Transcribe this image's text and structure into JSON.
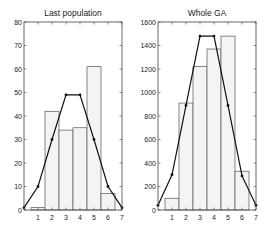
{
  "figure": {
    "width": 269,
    "height": 232
  },
  "chart_data": [
    {
      "type": "bar",
      "title": "Last population",
      "xlabel": "",
      "ylabel": "",
      "xlim": [
        0,
        7
      ],
      "ylim": [
        0,
        80
      ],
      "xticks": [
        1,
        2,
        3,
        4,
        5,
        6,
        7
      ],
      "yticks": [
        0,
        10,
        20,
        30,
        40,
        50,
        60,
        70,
        80
      ],
      "grid": false,
      "legend": null,
      "categories": [
        1,
        2,
        3,
        4,
        5,
        6
      ],
      "series": [
        {
          "name": "histogram",
          "type": "bar",
          "values": [
            1,
            42,
            34,
            35,
            61,
            7
          ]
        },
        {
          "name": "expected",
          "type": "line",
          "x": [
            0,
            1,
            2,
            3,
            4,
            5,
            6,
            7
          ],
          "values": [
            1,
            10,
            30,
            49,
            49,
            30,
            10,
            1
          ]
        }
      ],
      "colors": {
        "bar_fill": "#f4f4f4",
        "bar_edge": "#555555",
        "line": "#111111",
        "axis": "#444444"
      }
    },
    {
      "type": "bar",
      "title": "Whole GA",
      "xlabel": "",
      "ylabel": "",
      "xlim": [
        0,
        7
      ],
      "ylim": [
        0,
        1600
      ],
      "xticks": [
        1,
        2,
        3,
        4,
        5,
        6,
        7
      ],
      "yticks": [
        0,
        200,
        400,
        600,
        800,
        1000,
        1200,
        1400,
        1600
      ],
      "grid": false,
      "legend": null,
      "categories": [
        1,
        2,
        3,
        4,
        5,
        6
      ],
      "series": [
        {
          "name": "histogram",
          "type": "bar",
          "values": [
            100,
            910,
            1220,
            1370,
            1480,
            330
          ]
        },
        {
          "name": "expected",
          "type": "line",
          "x": [
            0,
            1,
            2,
            3,
            4,
            5,
            6,
            7
          ],
          "values": [
            40,
            300,
            890,
            1480,
            1480,
            890,
            290,
            40
          ]
        }
      ],
      "colors": {
        "bar_fill": "#f4f4f4",
        "bar_edge": "#555555",
        "line": "#111111",
        "axis": "#444444"
      }
    }
  ],
  "layout": [
    {
      "left": 24,
      "top": 22,
      "right": 122,
      "bottom": 210
    },
    {
      "left": 158,
      "top": 22,
      "right": 256,
      "bottom": 210
    }
  ]
}
